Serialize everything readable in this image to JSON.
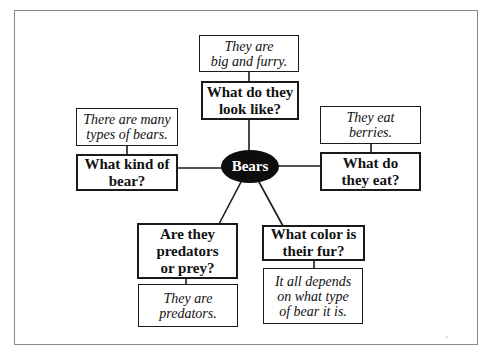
{
  "diagram": {
    "type": "concept-web",
    "center": {
      "label": "Bears"
    },
    "branches": [
      {
        "position": "top",
        "question": "What do they\nlook like?",
        "answer": "They are\nbig and furry."
      },
      {
        "position": "left",
        "question": "What kind of\nbear?",
        "answer": "There are many\ntypes of bears."
      },
      {
        "position": "right",
        "question": "What do\nthey eat?",
        "answer": "They eat\nberries."
      },
      {
        "position": "bottom-left",
        "question": "Are they\npredators\nor prey?",
        "answer": "They are\npredators."
      },
      {
        "position": "bottom-right",
        "question": "What color is\ntheir fur?",
        "answer": "It all depends\non what type\nof bear it is."
      }
    ],
    "colors": {
      "center_fill": "#0d0d0d",
      "center_text": "#ffffff",
      "box_border": "#1a1a1a",
      "frame_border": "#8a8a8a",
      "background": "#ffffff"
    }
  }
}
